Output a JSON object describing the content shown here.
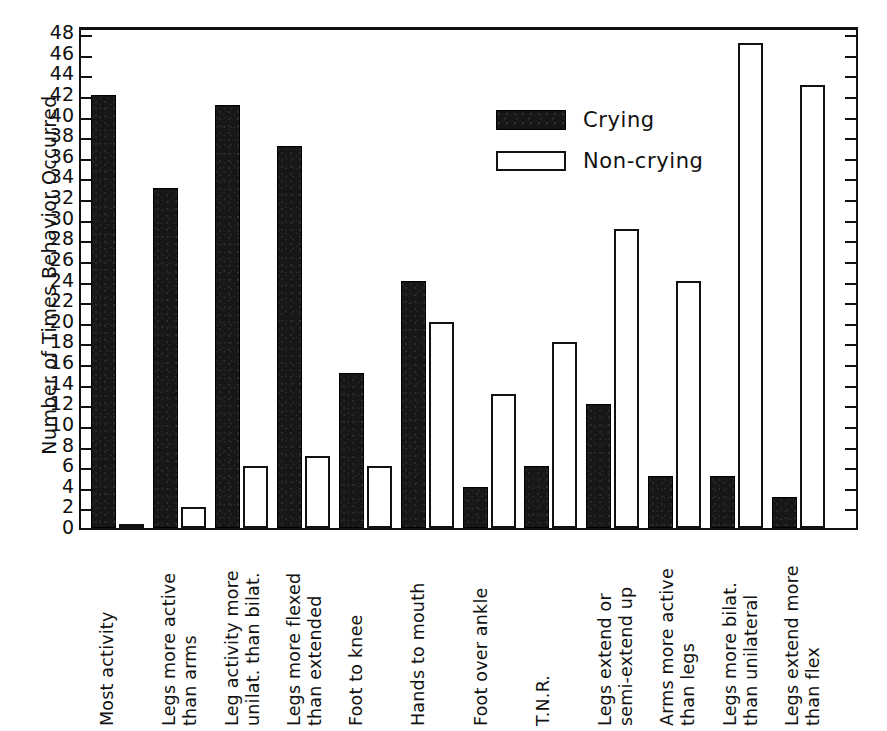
{
  "chart_data": {
    "type": "bar",
    "title": "",
    "xlabel": "",
    "ylabel": "Number of Times Behavior Occurred",
    "ylim": [
      0,
      48
    ],
    "ytick_step": 2,
    "grid": false,
    "legend_position": "upper-center",
    "categories": [
      "Most activity",
      "Legs more active than arms",
      "Leg activity more unilat. than bilat.",
      "Legs more flexed than extended",
      "Foot to knee",
      "Hands to mouth",
      "Foot over ankle",
      "T.N.R.",
      "Legs extend or semi-extend up",
      "Arms more active than legs",
      "Legs more bilat. than unilateral",
      "Legs extend more than flex"
    ],
    "category_lines": [
      [
        "Most activity",
        ""
      ],
      [
        "Legs more active",
        "than arms"
      ],
      [
        "Leg activity more",
        "unilat. than bilat."
      ],
      [
        "Legs more flexed",
        "than extended"
      ],
      [
        "Foot to knee",
        ""
      ],
      [
        "Hands to mouth",
        ""
      ],
      [
        "Foot over ankle",
        ""
      ],
      [
        "T.N.R.",
        ""
      ],
      [
        "Legs extend or",
        "semi-extend up"
      ],
      [
        "Arms more active",
        "than legs"
      ],
      [
        "Legs more bilat.",
        "than unilateral"
      ],
      [
        "Legs extend more",
        "than flex"
      ]
    ],
    "series": [
      {
        "name": "Crying",
        "color": "#171717",
        "values": [
          42,
          33,
          41,
          37,
          15,
          24,
          4,
          6,
          12,
          5,
          5,
          3
        ]
      },
      {
        "name": "Non-crying",
        "color": "#ffffff",
        "values": [
          0.3,
          2,
          6,
          7,
          6,
          20,
          13,
          18,
          29,
          24,
          47,
          43
        ]
      }
    ],
    "ytick_labels": [
      "0",
      "2",
      "4",
      "6",
      "8",
      "10",
      "12",
      "14",
      "16",
      "18",
      "20",
      "22",
      "24",
      "26",
      "28",
      "30",
      "32",
      "34",
      "36",
      "38",
      "40",
      "42",
      "44",
      "46",
      "48"
    ]
  },
  "legend": {
    "items": [
      {
        "label": "Crying"
      },
      {
        "label": "Non-crying"
      }
    ]
  }
}
